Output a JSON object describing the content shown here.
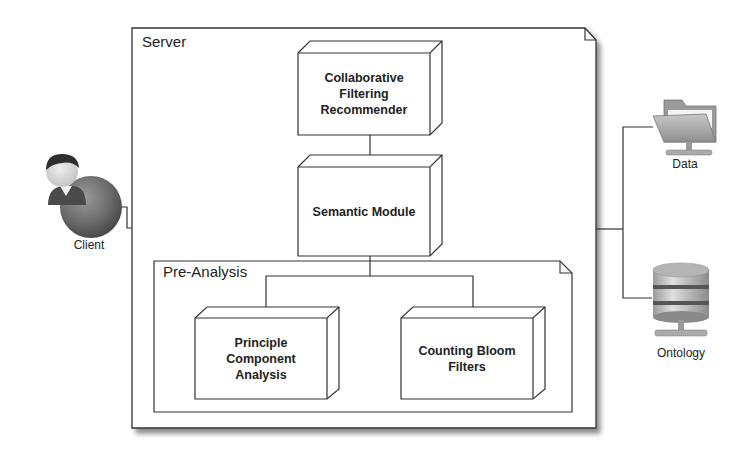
{
  "diagram": {
    "type": "deployment",
    "colors": {
      "line": "#333333",
      "shadow": "#9a9a9a",
      "background": "#ffffff",
      "text": "#222222"
    },
    "frames": {
      "server": {
        "title": "Server"
      },
      "pre_analysis": {
        "title": "Pre-Analysis"
      }
    },
    "nodes": {
      "collaborative_filtering": {
        "lines": [
          "Collaborative",
          "Filtering",
          "Recommender"
        ]
      },
      "semantic_module": {
        "lines": [
          "Semantic Module"
        ]
      },
      "pca": {
        "lines": [
          "Principle",
          "Component",
          "Analysis"
        ]
      },
      "counting_bloom": {
        "lines": [
          "Counting Bloom",
          "Filters"
        ]
      }
    },
    "actors": {
      "client": {
        "label": "Client",
        "icon": "user-globe-icon"
      },
      "data": {
        "label": "Data",
        "icon": "network-folder-icon"
      },
      "ontology": {
        "label": "Ontology",
        "icon": "database-server-icon"
      }
    },
    "edges": [
      {
        "from": "client",
        "to": "server"
      },
      {
        "from": "collaborative_filtering",
        "to": "semantic_module"
      },
      {
        "from": "semantic_module",
        "to": "pca"
      },
      {
        "from": "semantic_module",
        "to": "counting_bloom"
      },
      {
        "from": "server",
        "to": "data"
      },
      {
        "from": "server",
        "to": "ontology"
      }
    ]
  }
}
